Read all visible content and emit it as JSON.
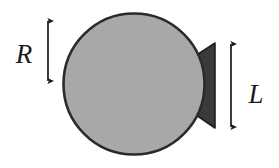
{
  "figure": {
    "background_color": "#ffffff",
    "labels": {
      "radius_label": "R",
      "length_label": "L"
    },
    "shapes": {
      "sphere": {
        "name": "sphere-body",
        "fill_color": "#a8a8a8",
        "stroke_color": "#2b2b2b",
        "center_x": 134,
        "center_y": 84,
        "radius_x": 71,
        "radius_y": 71
      },
      "cone": {
        "name": "cone-protrusion",
        "fill_color": "#3a3a3a",
        "stroke_color": "#1f1f1f",
        "tip_x": 192,
        "base_x": 215,
        "base_top_y": 43,
        "base_bottom_y": 128
      }
    },
    "dimensions": [
      {
        "name": "radius-dimension",
        "symbol": "R",
        "orientation": "vertical",
        "x": 48,
        "y_start": 20,
        "y_end": 82,
        "label_x": 24,
        "label_y": 58,
        "color": "#1a1a1a"
      },
      {
        "name": "length-dimension",
        "symbol": "L",
        "orientation": "vertical",
        "x": 231,
        "y_start": 43,
        "y_end": 128,
        "label_x": 255,
        "label_y": 97,
        "color": "#1a1a1a"
      }
    ]
  }
}
